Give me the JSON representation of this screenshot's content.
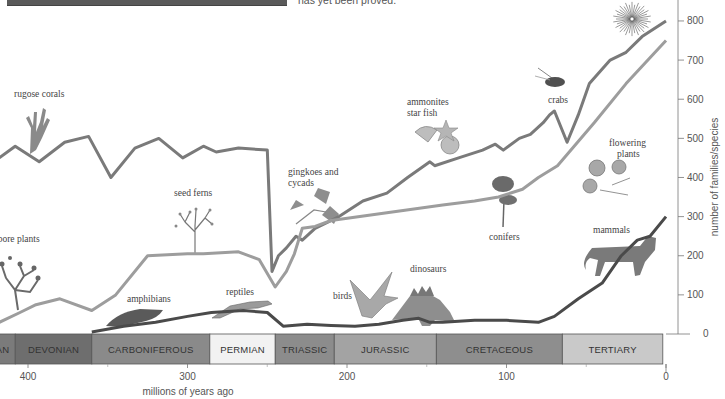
{
  "header": {
    "caption_text": "has yet been proved."
  },
  "chart_data": {
    "type": "line",
    "title": "",
    "xlabel": "millions of years ago",
    "ylabel": "number of families/species",
    "xlim": [
      420,
      0
    ],
    "ylim": [
      0,
      800
    ],
    "grid": false,
    "x_ticks": [
      400,
      300,
      200,
      100,
      0
    ],
    "y_ticks": [
      0,
      100,
      200,
      300,
      400,
      500,
      600,
      700,
      800
    ],
    "series": [
      {
        "name": "marine animal families",
        "color": "#7a7a7a",
        "x": [
          418,
          408,
          393,
          377,
          362,
          348,
          333,
          318,
          303,
          290,
          282,
          268,
          250,
          247,
          243,
          238,
          232,
          228,
          220,
          205,
          190,
          175,
          162,
          148,
          145,
          130,
          115,
          107,
          102,
          92,
          85,
          77,
          73,
          70,
          62,
          55,
          48,
          35,
          25,
          15,
          0
        ],
        "y": [
          450,
          480,
          440,
          490,
          505,
          400,
          475,
          500,
          450,
          480,
          465,
          475,
          470,
          160,
          200,
          220,
          250,
          240,
          270,
          300,
          340,
          360,
          400,
          440,
          430,
          450,
          470,
          485,
          470,
          500,
          510,
          540,
          560,
          570,
          490,
          560,
          640,
          700,
          720,
          760,
          800
        ]
      },
      {
        "name": "land plant species",
        "color": "#9d9d9d",
        "x": [
          418,
          405,
          395,
          380,
          360,
          345,
          325,
          300,
          290,
          268,
          255,
          245,
          238,
          233,
          228,
          220,
          210,
          175,
          140,
          120,
          105,
          90,
          80,
          68,
          45,
          25,
          0
        ],
        "y": [
          30,
          55,
          75,
          90,
          60,
          100,
          200,
          205,
          205,
          210,
          190,
          120,
          160,
          205,
          270,
          275,
          290,
          310,
          330,
          340,
          350,
          370,
          400,
          430,
          540,
          640,
          750
        ]
      },
      {
        "name": "land vertebrate families",
        "color": "#4a4a4a",
        "x": [
          360,
          340,
          320,
          300,
          285,
          265,
          250,
          240,
          225,
          210,
          195,
          180,
          165,
          155,
          148,
          140,
          120,
          100,
          80,
          70,
          55,
          40,
          28,
          18,
          10,
          0
        ],
        "y": [
          5,
          20,
          30,
          45,
          55,
          60,
          55,
          20,
          25,
          22,
          20,
          25,
          35,
          40,
          30,
          30,
          35,
          35,
          30,
          45,
          90,
          130,
          200,
          240,
          250,
          300
        ]
      }
    ],
    "periods": [
      {
        "name": "...AN",
        "label": "AN",
        "start": 435,
        "end": 408,
        "color": "#7b7b7b"
      },
      {
        "name": "Devonian",
        "label": "DEVONIAN",
        "start": 408,
        "end": 360,
        "color": "#6e6e6e"
      },
      {
        "name": "Carboniferous",
        "label": "CARBONIFEROUS",
        "start": 360,
        "end": 286,
        "color": "#8a8a8a"
      },
      {
        "name": "Permian",
        "label": "PERMIAN",
        "start": 286,
        "end": 245,
        "color": "#f2f2f2"
      },
      {
        "name": "Triassic",
        "label": "TRIASSIC",
        "start": 245,
        "end": 208,
        "color": "#8c8c8c"
      },
      {
        "name": "Jurassic",
        "label": "JURASSIC",
        "start": 208,
        "end": 144,
        "color": "#a3a3a3"
      },
      {
        "name": "Cretaceous",
        "label": "CRETACEOUS",
        "start": 144,
        "end": 65,
        "color": "#8e8e8e"
      },
      {
        "name": "Tertiary",
        "label": "TERTIARY",
        "start": 65,
        "end": 2,
        "color": "#c9c9c9"
      }
    ],
    "annotations": [
      {
        "text": "rugose corals",
        "x": 14,
        "y": 97
      },
      {
        "text": "seed ferns",
        "x": 174,
        "y": 196
      },
      {
        "text": "spore plants",
        "x": -6,
        "y": 242
      },
      {
        "text": "amphibians",
        "x": 127,
        "y": 302
      },
      {
        "text": "reptiles",
        "x": 226,
        "y": 295
      },
      {
        "text": "gingkoes and",
        "x": 288,
        "y": 175
      },
      {
        "text": "cycads",
        "x": 288,
        "y": 186
      },
      {
        "text": "ammonites",
        "x": 407,
        "y": 105
      },
      {
        "text": "star fish",
        "x": 407,
        "y": 116
      },
      {
        "text": "crabs",
        "x": 548,
        "y": 103
      },
      {
        "text": "flowering",
        "x": 609,
        "y": 146
      },
      {
        "text": "plants",
        "x": 617,
        "y": 157
      },
      {
        "text": "conifers",
        "x": 489,
        "y": 240
      },
      {
        "text": "mammals",
        "x": 593,
        "y": 233
      },
      {
        "text": "birds",
        "x": 333,
        "y": 299
      },
      {
        "text": "dinosaurs",
        "x": 410,
        "y": 272
      }
    ]
  }
}
